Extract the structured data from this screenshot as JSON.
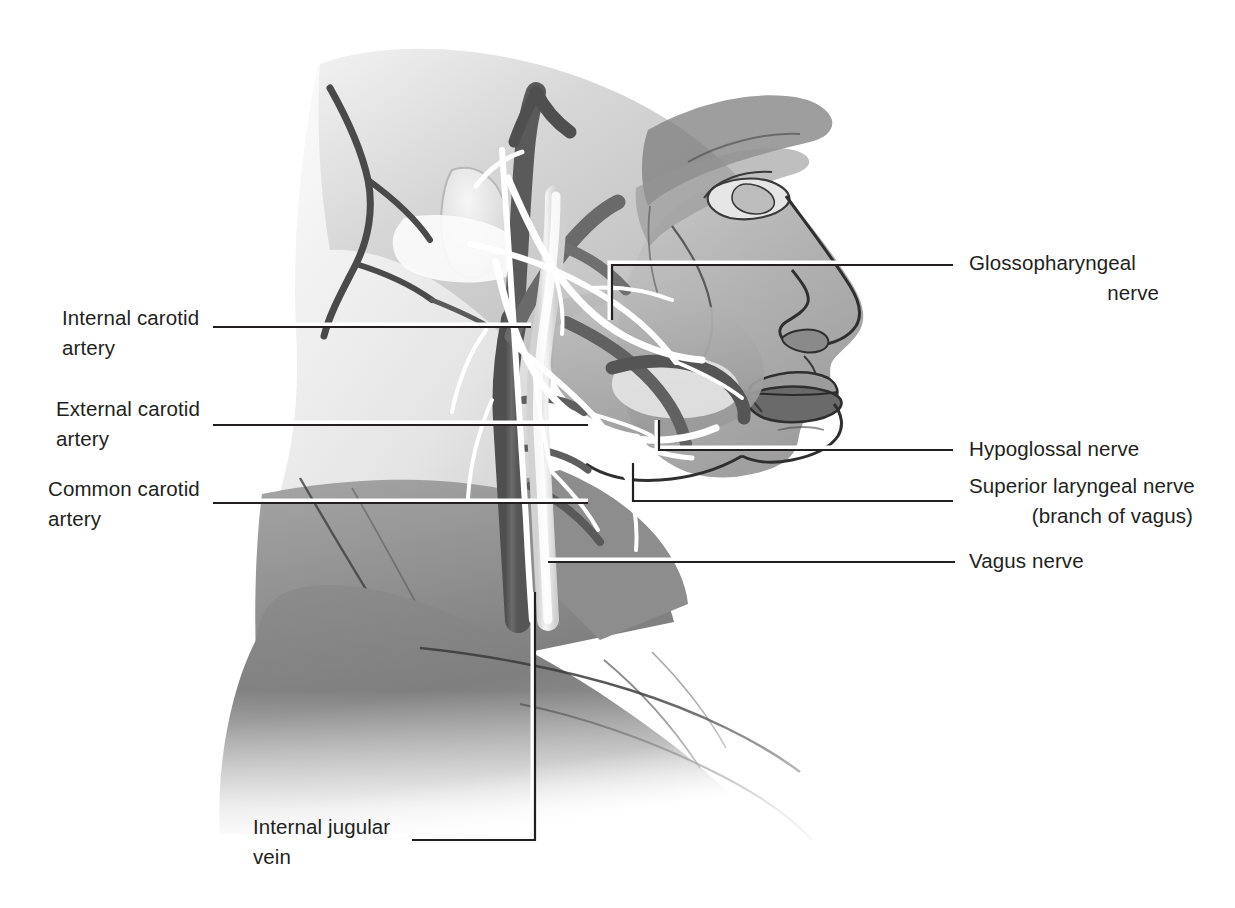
{
  "figure": {
    "background_color": "#ffffff",
    "text_color": "#231f20",
    "leader_line_color": "#231f20",
    "leader_line_highlight_color": "#ffffff"
  },
  "labels": {
    "internal_carotid_artery": {
      "line1": "Internal carotid",
      "line2": "artery"
    },
    "external_carotid_artery": {
      "line1": "External carotid",
      "line2": "artery"
    },
    "common_carotid_artery": {
      "line1": "Common carotid",
      "line2": "artery"
    },
    "internal_jugular_vein": {
      "line1": "Internal jugular",
      "line2": "vein"
    },
    "glossopharyngeal_nerve": {
      "line1": "Glossopharyngeal",
      "line2": "nerve"
    },
    "hypoglossal_nerve": {
      "line1": "Hypoglossal nerve"
    },
    "superior_laryngeal_nerve": {
      "line1": "Superior laryngeal nerve",
      "line2": "(branch of vagus)"
    },
    "vagus_nerve": {
      "line1": "Vagus nerve"
    }
  },
  "anatomy": {
    "structures": [
      "skull",
      "face-profile",
      "neck",
      "shoulder",
      "mandible",
      "internal-carotid-artery",
      "external-carotid-artery",
      "common-carotid-artery",
      "internal-jugular-vein",
      "glossopharyngeal-nerve",
      "hypoglossal-nerve",
      "superior-laryngeal-nerve",
      "vagus-nerve"
    ],
    "palette": {
      "tissue_light": "#d9d9d9",
      "tissue_mid": "#a8a8a8",
      "tissue_dark": "#8a8a8a",
      "tissue_deep": "#6e6e6e",
      "artery_dark": "#5c5c5c",
      "vein_light": "#e8e8e8",
      "nerve_white": "#ffffff",
      "outline": "#3a3a3a"
    }
  }
}
